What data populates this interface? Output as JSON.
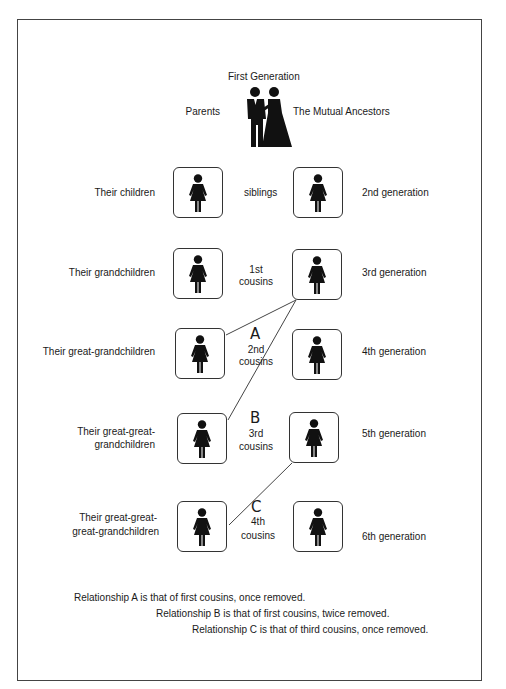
{
  "header": {
    "title": "First Generation",
    "left_label": "Parents",
    "right_label": "The Mutual Ancestors",
    "icon": "couple-icon"
  },
  "rows": [
    {
      "left_label": "Their children",
      "middle_label_1": "siblings",
      "middle_label_2": "",
      "right_label": "2nd  generation"
    },
    {
      "left_label": "Their grandchildren",
      "middle_label_1": "1st",
      "middle_label_2": "cousins",
      "right_label": "3rd generation"
    },
    {
      "left_label_1": "Their great-grandchildren",
      "letter": "A",
      "middle_label_1": "2nd",
      "middle_label_2": "cousins",
      "right_label": "4th generation"
    },
    {
      "left_label_1": "Their great-great-",
      "left_label_2": "grandchildren",
      "letter": "B",
      "middle_label_1": "3rd",
      "middle_label_2": "cousins",
      "right_label": "5th generation"
    },
    {
      "left_label_1": "Their great-great-",
      "left_label_2": "great-grandchildren",
      "letter": "C",
      "middle_label_1": "4th",
      "middle_label_2": "cousins",
      "right_label": "6th generation"
    }
  ],
  "person_icon": "woman-icon",
  "notes": [
    "Relationship A is that of first cousins, once removed.",
    "Relationship B is that of first cousins, twice removed.",
    "Relationship C is that of third cousins, once removed."
  ],
  "colors": {
    "line": "#444444",
    "icon": "#111111",
    "text": "#1a1a1a"
  }
}
